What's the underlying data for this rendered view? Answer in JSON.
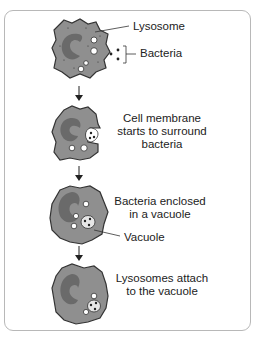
{
  "title_cropped": "Phagocytosis",
  "colors": {
    "cytoplasm": "#8f8f8f",
    "nucleus": "#6a6a6a",
    "outline": "#333333",
    "frame": "#b8b8b8"
  },
  "stages": [
    {
      "id": 1,
      "labels": {
        "lysosome": "Lysosome",
        "bacteria": "Bacteria"
      }
    },
    {
      "id": 2,
      "caption": [
        "Cell membrane",
        "starts to surround",
        "bacteria"
      ]
    },
    {
      "id": 3,
      "caption": [
        "Bacteria enclosed",
        "in a vacuole"
      ],
      "labels": {
        "vacuole": "Vacuole"
      }
    },
    {
      "id": 4,
      "caption": [
        "Lysosomes attach",
        "to the vacuole"
      ]
    }
  ]
}
